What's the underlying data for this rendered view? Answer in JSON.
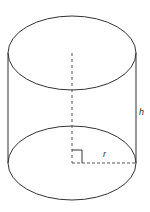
{
  "diagram": {
    "shape": "cylinder",
    "labels": {
      "height": "h",
      "radius": "r"
    },
    "colors": {
      "stroke": "#333333",
      "dashed": "#555555",
      "background": "#ffffff"
    }
  }
}
